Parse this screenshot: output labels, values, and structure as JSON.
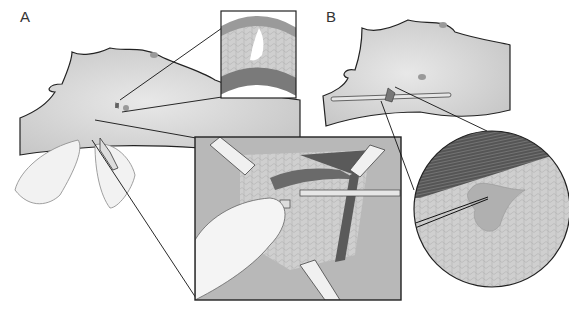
{
  "figure": {
    "panels": [
      {
        "label": "A",
        "description": "Patient side view with incision; inset of tissue layers; magnified wound cleaning with retractors"
      },
      {
        "label": "B",
        "description": "Patient side view with drain tube; magnified circular view of pocket in tissue"
      }
    ]
  },
  "colors": {
    "skin": "#d4d4d4",
    "outline": "#222222",
    "muscle": "#6a6a6a",
    "tissue": "#c8c8c8",
    "glove": "#f0f0f0"
  }
}
